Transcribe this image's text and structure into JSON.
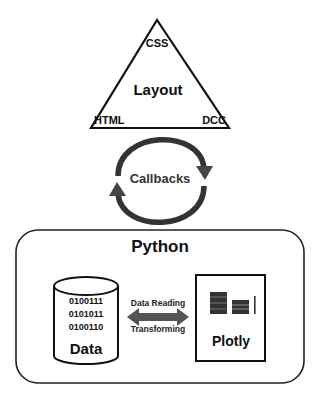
{
  "layout_triangle": {
    "title": "Layout",
    "top": "CSS",
    "bottom_left": "HTML",
    "bottom_right": "DCC"
  },
  "callbacks": {
    "label": "Callbacks",
    "arrow_color": "#444444"
  },
  "python_box": {
    "title": "Python",
    "data_store": {
      "bits": [
        "0100111",
        "0101011",
        "0100110"
      ],
      "label": "Data"
    },
    "link": {
      "top_label": "Data Reading",
      "bottom_label": "Transforming",
      "arrow_color": "#555555"
    },
    "plotly": {
      "label": "Plotly",
      "icon": "bar-chart-icon"
    }
  }
}
